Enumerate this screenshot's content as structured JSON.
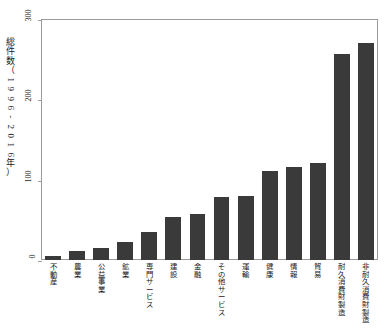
{
  "chart_data": {
    "type": "bar",
    "title": "",
    "xlabel": "",
    "ylabel": "総件数（1996-2016年）",
    "ylim": [
      0,
      300
    ],
    "yticks": [
      0,
      100,
      200,
      300
    ],
    "ytick_labels": [
      "0",
      "100",
      "200",
      "300"
    ],
    "grid": false,
    "legend": null,
    "bar_color": "#3a3a3a",
    "axis_color": "#9a9a9a",
    "categories": [
      "不動産",
      "農業",
      "公益事業",
      "鉱業",
      "専門サービス",
      "建設",
      "金融",
      "その他サービス",
      "運輸",
      "健康",
      "情報",
      "貿易",
      "耐久消費財製造",
      "非耐久消費財製造"
    ],
    "values": [
      5,
      11,
      15,
      22,
      35,
      53,
      57,
      78,
      80,
      111,
      116,
      121,
      257,
      270
    ]
  }
}
